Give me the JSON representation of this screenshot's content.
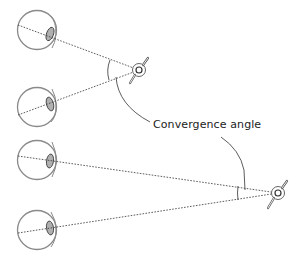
{
  "diagram": {
    "label": "Convergence angle",
    "colors": {
      "eye_outline": "#8a8a8a",
      "lens_fill": "#b0b0b0",
      "line": "#333333",
      "background": "#ffffff"
    },
    "scenarios": [
      {
        "name": "near-target",
        "eyes": [
          {
            "cx": 37,
            "cy": 30
          },
          {
            "cx": 37,
            "cy": 107
          }
        ],
        "target": {
          "x": 139,
          "y": 70
        }
      },
      {
        "name": "far-target",
        "eyes": [
          {
            "cx": 37,
            "cy": 160
          },
          {
            "cx": 37,
            "cy": 230
          }
        ],
        "target": {
          "x": 278,
          "y": 193
        }
      }
    ]
  }
}
